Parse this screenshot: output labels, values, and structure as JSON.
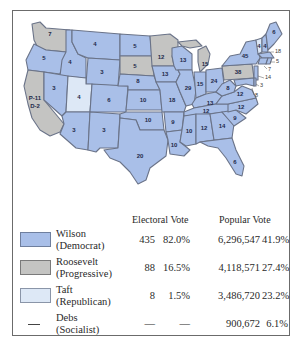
{
  "colors": {
    "wilson": "#a9bfe8",
    "roosevelt": "#c4c4c2",
    "taft": "#dde8f6",
    "border": "#6a7388",
    "frame": "#6b6b6b",
    "text": "#2a2a2a"
  },
  "map": {
    "states": [
      {
        "id": "WA",
        "label": "7",
        "party": "roosevelt"
      },
      {
        "id": "OR",
        "label": "5",
        "party": "wilson"
      },
      {
        "id": "CA",
        "label": "P-11\nD-2",
        "party": "roosevelt"
      },
      {
        "id": "ID",
        "label": "4",
        "party": "wilson"
      },
      {
        "id": "NV",
        "label": "3",
        "party": "wilson"
      },
      {
        "id": "MT",
        "label": "4",
        "party": "wilson"
      },
      {
        "id": "WY",
        "label": "3",
        "party": "wilson"
      },
      {
        "id": "UT",
        "label": "4",
        "party": "taft"
      },
      {
        "id": "CO",
        "label": "6",
        "party": "wilson"
      },
      {
        "id": "AZ",
        "label": "3",
        "party": "wilson"
      },
      {
        "id": "NM",
        "label": "3",
        "party": "wilson"
      },
      {
        "id": "ND",
        "label": "5",
        "party": "wilson"
      },
      {
        "id": "SD",
        "label": "5",
        "party": "roosevelt"
      },
      {
        "id": "NE",
        "label": "8",
        "party": "wilson"
      },
      {
        "id": "KS",
        "label": "10",
        "party": "wilson"
      },
      {
        "id": "OK",
        "label": "10",
        "party": "wilson"
      },
      {
        "id": "TX",
        "label": "20",
        "party": "wilson"
      },
      {
        "id": "MN",
        "label": "12",
        "party": "roosevelt"
      },
      {
        "id": "IA",
        "label": "13",
        "party": "wilson"
      },
      {
        "id": "MO",
        "label": "18",
        "party": "wilson"
      },
      {
        "id": "AR",
        "label": "9",
        "party": "wilson"
      },
      {
        "id": "LA",
        "label": "10",
        "party": "wilson"
      },
      {
        "id": "WI",
        "label": "13",
        "party": "wilson"
      },
      {
        "id": "IL",
        "label": "29",
        "party": "wilson"
      },
      {
        "id": "MI",
        "label": "15",
        "party": "roosevelt"
      },
      {
        "id": "IN",
        "label": "15",
        "party": "wilson"
      },
      {
        "id": "OH",
        "label": "24",
        "party": "wilson"
      },
      {
        "id": "KY",
        "label": "13",
        "party": "wilson"
      },
      {
        "id": "TN",
        "label": "12",
        "party": "wilson"
      },
      {
        "id": "MS",
        "label": "10",
        "party": "wilson"
      },
      {
        "id": "AL",
        "label": "12",
        "party": "wilson"
      },
      {
        "id": "GA",
        "label": "14",
        "party": "wilson"
      },
      {
        "id": "FL",
        "label": "6",
        "party": "wilson"
      },
      {
        "id": "SC",
        "label": "9",
        "party": "wilson"
      },
      {
        "id": "NC",
        "label": "12",
        "party": "wilson"
      },
      {
        "id": "VA",
        "label": "12",
        "party": "wilson"
      },
      {
        "id": "WV",
        "label": "8",
        "party": "wilson"
      },
      {
        "id": "PA",
        "label": "38",
        "party": "roosevelt"
      },
      {
        "id": "NY",
        "label": "45",
        "party": "wilson"
      },
      {
        "id": "VT",
        "label": "4",
        "party": "taft"
      },
      {
        "id": "NH",
        "label": "4",
        "party": "wilson"
      },
      {
        "id": "ME",
        "label": "6",
        "party": "wilson"
      },
      {
        "id": "MA",
        "label": "18",
        "party": "wilson"
      },
      {
        "id": "RI",
        "label": "5",
        "party": "wilson"
      },
      {
        "id": "CT",
        "label": "7",
        "party": "wilson"
      },
      {
        "id": "NJ",
        "label": "14",
        "party": "wilson"
      },
      {
        "id": "DE",
        "label": "3",
        "party": "wilson"
      },
      {
        "id": "MD",
        "label": "8",
        "party": "wilson"
      }
    ]
  },
  "legend": {
    "headers": {
      "electoral": "Electoral Vote",
      "popular": "Popular Vote"
    },
    "rows": [
      {
        "name": "Wilson",
        "party": "(Democrat)",
        "swatch": "wilson",
        "ev": "435",
        "ev_pct": "82.0%",
        "pv": "6,296,547",
        "pv_pct": "41.9%"
      },
      {
        "name": "Roosevelt",
        "party": "(Progressive)",
        "swatch": "roosevelt",
        "ev": "88",
        "ev_pct": "16.5%",
        "pv": "4,118,571",
        "pv_pct": "27.4%"
      },
      {
        "name": "Taft",
        "party": "(Republican)",
        "swatch": "taft",
        "ev": "8",
        "ev_pct": "1.5%",
        "pv": "3,486,720",
        "pv_pct": "23.2%"
      },
      {
        "name": "Debs",
        "party": "(Socialist)",
        "swatch": "none",
        "ev": "—",
        "ev_pct": "—",
        "pv": "900,672",
        "pv_pct": "6.1%"
      }
    ]
  }
}
